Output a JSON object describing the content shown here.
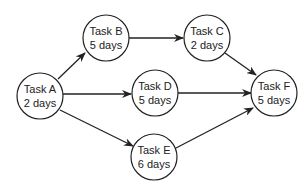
{
  "diagram": {
    "type": "activity-network",
    "nodes": [
      {
        "id": "A",
        "name": "Task A",
        "duration": "2 days",
        "cx": 40,
        "cy": 96
      },
      {
        "id": "B",
        "name": "Task B",
        "duration": "5 days",
        "cx": 106,
        "cy": 38
      },
      {
        "id": "C",
        "name": "Task C",
        "duration": "2 days",
        "cx": 207,
        "cy": 38
      },
      {
        "id": "D",
        "name": "Task D",
        "duration": "5 days",
        "cx": 155,
        "cy": 93
      },
      {
        "id": "E",
        "name": "Task E",
        "duration": "6 days",
        "cx": 154,
        "cy": 157
      },
      {
        "id": "F",
        "name": "Task F",
        "duration": "5 days",
        "cx": 274,
        "cy": 93
      }
    ],
    "edges": [
      {
        "from": "A",
        "to": "B"
      },
      {
        "from": "A",
        "to": "D"
      },
      {
        "from": "A",
        "to": "E"
      },
      {
        "from": "B",
        "to": "C"
      },
      {
        "from": "C",
        "to": "F"
      },
      {
        "from": "D",
        "to": "F"
      },
      {
        "from": "E",
        "to": "F"
      }
    ],
    "colors": {
      "stroke": "#222222",
      "fill": "#ffffff",
      "text": "#222222"
    }
  }
}
